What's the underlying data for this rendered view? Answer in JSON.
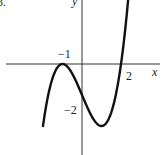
{
  "problem_label": "3.",
  "chart_data": {
    "type": "line",
    "title": "",
    "xlabel": "x",
    "ylabel": "y",
    "function": "f(x) = (x+1)^2 (x-2)",
    "tick_labels": {
      "x": [
        "-1",
        "2"
      ],
      "y": [
        "-2"
      ]
    },
    "key_points": [
      {
        "x": -1,
        "y": 0,
        "note": "local maximum, touches x-axis"
      },
      {
        "x": 0,
        "y": -2,
        "note": "y-intercept"
      },
      {
        "x": 1,
        "y": -4,
        "note": "local minimum"
      },
      {
        "x": 2,
        "y": 0,
        "note": "x-intercept"
      }
    ],
    "x": [
      -2.0,
      -1.5,
      -1.0,
      -0.5,
      0.0,
      0.5,
      1.0,
      1.5,
      2.0,
      2.5
    ],
    "y": [
      -4.0,
      -0.875,
      0.0,
      -0.625,
      -2.0,
      -3.375,
      -4.0,
      -3.125,
      0.0,
      6.125
    ],
    "xlim": [
      -2.0,
      2.6
    ],
    "ylim": [
      -4.8,
      3.5
    ],
    "grid": false,
    "legend": false
  },
  "labels": {
    "x_axis": "x",
    "y_axis": "y",
    "tick_neg1": "−1",
    "tick_2": "2",
    "tick_neg2": "−2"
  }
}
